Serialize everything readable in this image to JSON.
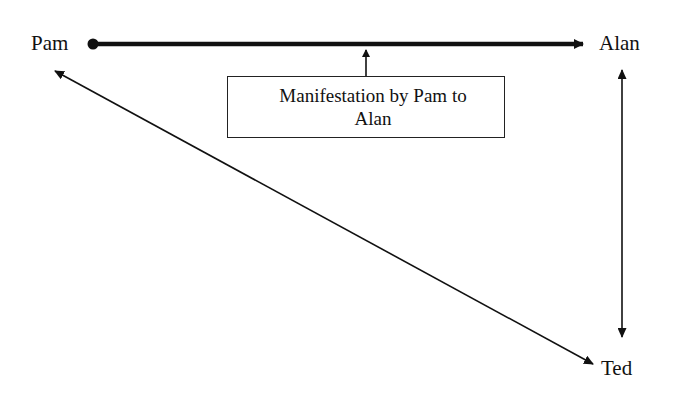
{
  "diagram": {
    "nodes": [
      {
        "id": "pam",
        "label": "Pam"
      },
      {
        "id": "alan",
        "label": "Alan"
      },
      {
        "id": "ted",
        "label": "Ted"
      }
    ],
    "edges": [
      {
        "from": "pam",
        "to": "alan",
        "style": "thick",
        "direction": "forward",
        "start_marker": "dot"
      },
      {
        "from": "alan",
        "to": "ted",
        "style": "thin",
        "direction": "both"
      },
      {
        "from": "pam",
        "to": "ted",
        "style": "thin",
        "direction": "both"
      }
    ],
    "annotation": {
      "line1": "Manifestation by Pam to",
      "line2": "Alan",
      "points_to": "pam-alan edge"
    },
    "colors": {
      "stroke": "#111111",
      "background": "#ffffff"
    }
  }
}
